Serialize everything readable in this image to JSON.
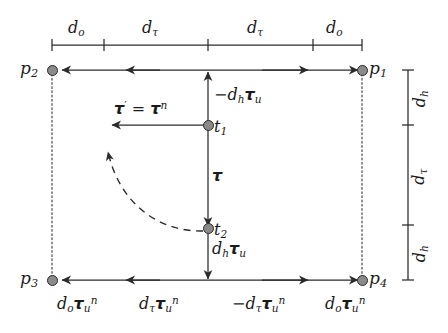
{
  "figure": {
    "type": "vector-diagram"
  },
  "points": {
    "p1": "p",
    "p1_sub": "1",
    "p2": "p",
    "p2_sub": "2",
    "p3": "p",
    "p3_sub": "3",
    "p4": "p",
    "p4_sub": "4",
    "t1": "t",
    "t1_sub": "1",
    "t2": "t",
    "t2_sub": "2"
  },
  "top_ruler": {
    "segments": [
      {
        "d": "d",
        "sub": "o"
      },
      {
        "d": "d",
        "sub": "τ"
      },
      {
        "d": "d",
        "sub": "τ"
      },
      {
        "d": "d",
        "sub": "o"
      }
    ]
  },
  "right_ruler": {
    "segments": [
      {
        "d": "d",
        "sub": "h"
      },
      {
        "d": "d",
        "sub": "τ"
      },
      {
        "d": "d",
        "sub": "h"
      }
    ]
  },
  "vectors": {
    "up_label": {
      "sign": "−",
      "d": "d",
      "d_sub": "h",
      "tau": "τ",
      "tau_sub": "u"
    },
    "down_label": {
      "sign": "",
      "d": "d",
      "d_sub": "h",
      "tau": "τ",
      "tau_sub": "u"
    },
    "tau_plain": {
      "tau": "τ"
    },
    "tau_prime": {
      "lhs_tau": "τ",
      "prime": "′",
      "eq": "=",
      "rhs_tau": "τ",
      "rhs_sup": "n"
    }
  },
  "bottom_labels": [
    {
      "sign": "",
      "d": "d",
      "d_sub": "o",
      "tau": "τ",
      "tau_sub": "u",
      "tau_sup": "n"
    },
    {
      "sign": "",
      "d": "d",
      "d_sub": "τ",
      "tau": "τ",
      "tau_sub": "u",
      "tau_sup": "n"
    },
    {
      "sign": "−",
      "d": "d",
      "d_sub": "τ",
      "tau": "τ",
      "tau_sub": "u",
      "tau_sup": "n"
    },
    {
      "sign": "",
      "d": "d",
      "d_sub": "o",
      "tau": "τ",
      "tau_sub": "u",
      "tau_sup": "n"
    }
  ],
  "colors": {
    "stroke": "#2b2b2b",
    "node_fill": "#8a8a8a",
    "background": "#ffffff",
    "dotted": "#555555"
  }
}
